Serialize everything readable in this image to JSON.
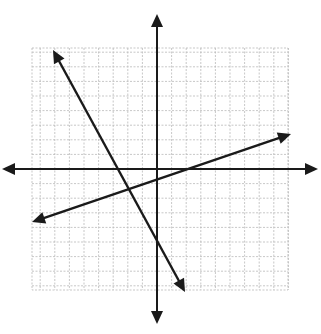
{
  "figure": {
    "type": "coordinate-plane",
    "grid": {
      "left": 32,
      "right": 288,
      "top": 48,
      "bottom": 290,
      "spacing": 14.6,
      "color": "#b9b9b9"
    },
    "origin": {
      "x": 157,
      "y": 169
    },
    "axes": {
      "color": "#1a1a1a",
      "x_axis": {
        "x1": 2,
        "x2": 318,
        "y": 169
      },
      "y_axis": {
        "x": 157,
        "y1": 14,
        "y2": 324
      }
    },
    "lines": [
      {
        "name": "steep-line",
        "x1": 53,
        "y1": 50,
        "x2": 185,
        "y2": 292,
        "color": "#1a1a1a",
        "arrows": "both"
      },
      {
        "name": "shallow-line",
        "x1": 32,
        "y1": 222,
        "x2": 291,
        "y2": 134,
        "color": "#1a1a1a",
        "arrows": "both"
      }
    ],
    "intersection_approx": {
      "x": 130,
      "y": 187
    }
  }
}
